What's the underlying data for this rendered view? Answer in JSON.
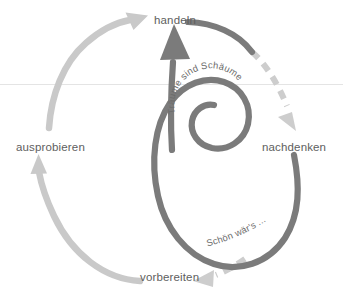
{
  "diagram": {
    "background_color": "#ffffff",
    "baseline_rule": {
      "name": "horizontal-rule",
      "y": 84,
      "color": "#e2e2e2"
    },
    "colors": {
      "dark_arrow": "#7b7b7b",
      "light_arrow": "#c9c9c9",
      "dashed_arrow": "#cdcdcd",
      "label_text": "#5e5e5e",
      "curve_text": "#6b6b6b"
    },
    "nodes": [
      {
        "id": "handeln",
        "label": "handeln",
        "x": 154,
        "y": 14
      },
      {
        "id": "ausprobieren",
        "label": "ausprobieren",
        "x": 16,
        "y": 141
      },
      {
        "id": "nachdenken",
        "label": "nachdenken",
        "x": 262,
        "y": 141
      },
      {
        "id": "vorbereiten",
        "label": "vorbereiten",
        "x": 140,
        "y": 271
      }
    ],
    "annotations": [
      {
        "id": "traeume",
        "text": "Träume sind Schäume",
        "style": "curved-along-inner-spiral"
      },
      {
        "id": "schoen",
        "text": "Schön wär's ...",
        "style": "curved-along-lower-loop"
      }
    ],
    "edges": [
      {
        "id": "edge-vorbereiten-ausprobieren",
        "from": "vorbereiten",
        "to": "ausprobieren",
        "style": "solid",
        "color": "#c9c9c9"
      },
      {
        "id": "edge-ausprobieren-handeln",
        "from": "ausprobieren",
        "to": "handeln",
        "style": "solid",
        "color": "#c9c9c9"
      },
      {
        "id": "edge-handeln-nachdenken",
        "from": "handeln",
        "to": "nachdenken",
        "style": "dashed",
        "color": "#cdcdcd"
      },
      {
        "id": "edge-nachdenken-vorbereiten",
        "from": "nachdenken",
        "to": "vorbereiten",
        "style": "dashed",
        "color": "#cdcdcd"
      },
      {
        "id": "edge-spiral-inner",
        "from": "nachdenken",
        "to": "handeln",
        "style": "solid",
        "color": "#7b7b7b"
      }
    ]
  }
}
